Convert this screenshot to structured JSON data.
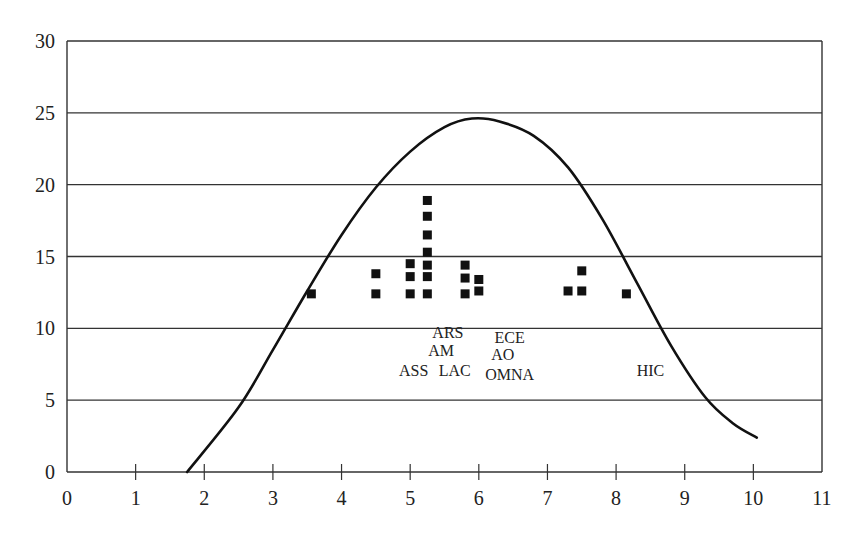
{
  "chart_data": {
    "type": "scatter",
    "title": "",
    "xlabel": "",
    "ylabel": "",
    "xlim": [
      0,
      11
    ],
    "ylim": [
      0,
      30
    ],
    "x_ticks": [
      0,
      1,
      2,
      3,
      4,
      5,
      6,
      7,
      8,
      9,
      10,
      11
    ],
    "y_ticks": [
      0,
      5,
      10,
      15,
      20,
      25,
      30
    ],
    "grid": {
      "horizontal": true,
      "vertical": false
    },
    "legend": null,
    "series": [
      {
        "name": "points",
        "kind": "scatter",
        "marker": "square",
        "color": "#111111",
        "points": [
          {
            "x": 3.56,
            "y": 12.4
          },
          {
            "x": 4.5,
            "y": 13.8
          },
          {
            "x": 4.5,
            "y": 12.4
          },
          {
            "x": 5.0,
            "y": 14.5
          },
          {
            "x": 5.0,
            "y": 13.6
          },
          {
            "x": 5.0,
            "y": 12.4
          },
          {
            "x": 5.25,
            "y": 18.9
          },
          {
            "x": 5.25,
            "y": 17.8
          },
          {
            "x": 5.25,
            "y": 16.5
          },
          {
            "x": 5.25,
            "y": 15.3
          },
          {
            "x": 5.25,
            "y": 14.4
          },
          {
            "x": 5.25,
            "y": 13.6
          },
          {
            "x": 5.25,
            "y": 12.4
          },
          {
            "x": 5.8,
            "y": 14.4
          },
          {
            "x": 5.8,
            "y": 13.5
          },
          {
            "x": 5.8,
            "y": 12.4
          },
          {
            "x": 6.0,
            "y": 13.4
          },
          {
            "x": 6.0,
            "y": 12.6
          },
          {
            "x": 7.3,
            "y": 12.6
          },
          {
            "x": 7.5,
            "y": 14.0
          },
          {
            "x": 7.5,
            "y": 12.6
          },
          {
            "x": 8.15,
            "y": 12.4
          }
        ]
      },
      {
        "name": "curve",
        "kind": "line",
        "color": "#111111",
        "points": [
          {
            "x": 1.75,
            "y": 0.0
          },
          {
            "x": 2.5,
            "y": 4.5
          },
          {
            "x": 3.0,
            "y": 8.5
          },
          {
            "x": 3.5,
            "y": 12.6
          },
          {
            "x": 4.0,
            "y": 16.5
          },
          {
            "x": 4.5,
            "y": 19.8
          },
          {
            "x": 5.0,
            "y": 22.3
          },
          {
            "x": 5.5,
            "y": 24.0
          },
          {
            "x": 5.9,
            "y": 24.6
          },
          {
            "x": 6.3,
            "y": 24.4
          },
          {
            "x": 6.8,
            "y": 23.4
          },
          {
            "x": 7.3,
            "y": 21.2
          },
          {
            "x": 7.8,
            "y": 17.6
          },
          {
            "x": 8.3,
            "y": 13.2
          },
          {
            "x": 8.8,
            "y": 8.8
          },
          {
            "x": 9.3,
            "y": 5.2
          },
          {
            "x": 9.7,
            "y": 3.4
          },
          {
            "x": 10.05,
            "y": 2.4
          }
        ]
      }
    ],
    "annotations": [
      {
        "text": "ARS",
        "x": 5.55,
        "y": 9.3
      },
      {
        "text": "AM",
        "x": 5.45,
        "y": 8.1
      },
      {
        "text": "ASS",
        "x": 5.05,
        "y": 6.7
      },
      {
        "text": "LAC",
        "x": 5.65,
        "y": 6.7
      },
      {
        "text": "ECE",
        "x": 6.45,
        "y": 9.0
      },
      {
        "text": "AO",
        "x": 6.35,
        "y": 7.8
      },
      {
        "text": "OMNA",
        "x": 6.45,
        "y": 6.4
      },
      {
        "text": "HIC",
        "x": 8.5,
        "y": 6.7
      }
    ]
  }
}
